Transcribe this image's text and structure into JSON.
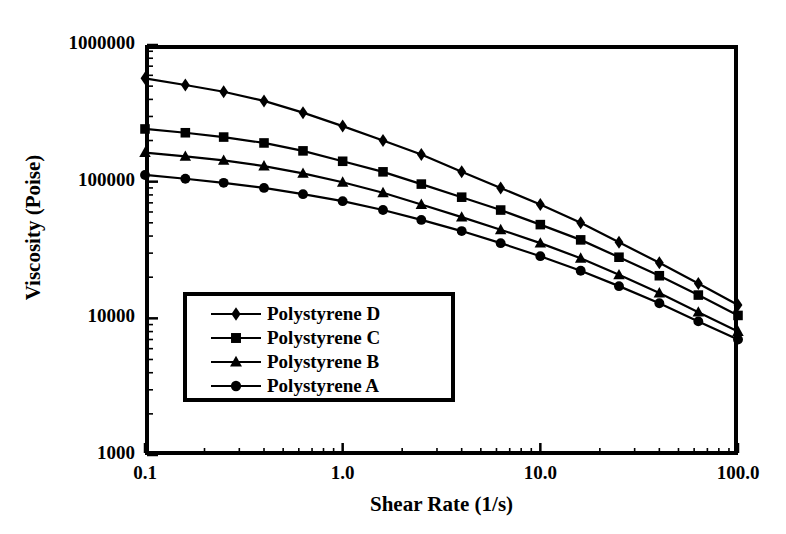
{
  "chart_data": {
    "type": "line",
    "title": "",
    "xlabel": "Shear Rate (1/s)",
    "ylabel": "Viscosity (Poise)",
    "xscale": "log",
    "yscale": "log",
    "xlim": [
      0.1,
      100.0
    ],
    "ylim": [
      1000,
      1000000
    ],
    "grid": false,
    "legend_position": "inside-left-lower",
    "xticks": [
      {
        "value": 0.1,
        "label": "0.1"
      },
      {
        "value": 1.0,
        "label": "1.0"
      },
      {
        "value": 10.0,
        "label": "10.0"
      },
      {
        "value": 100.0,
        "label": "100.0"
      }
    ],
    "yticks": [
      {
        "value": 1000,
        "label": "1000"
      },
      {
        "value": 10000,
        "label": "10000"
      },
      {
        "value": 100000,
        "label": "100000"
      },
      {
        "value": 1000000,
        "label": "1000000"
      }
    ],
    "x": [
      0.1,
      0.16,
      0.25,
      0.4,
      0.63,
      1.0,
      1.6,
      2.5,
      4.0,
      6.3,
      10.0,
      16.0,
      25.0,
      40.0,
      63.0,
      100.0
    ],
    "series": [
      {
        "name": "Polystyrene D",
        "marker": "diamond",
        "color": "#000000",
        "values": [
          570000,
          510000,
          455000,
          390000,
          320000,
          255000,
          200000,
          158000,
          118000,
          90000,
          68000,
          50000,
          36000,
          25500,
          18000,
          12500
        ]
      },
      {
        "name": "Polystyrene C",
        "marker": "square",
        "color": "#000000",
        "values": [
          243000,
          228000,
          212000,
          192000,
          168000,
          141000,
          118000,
          96000,
          77000,
          62000,
          48500,
          37500,
          28000,
          20500,
          14800,
          10500
        ]
      },
      {
        "name": "Polystyrene B",
        "marker": "triangle",
        "color": "#000000",
        "values": [
          163000,
          153000,
          143000,
          130000,
          115000,
          99000,
          83000,
          68000,
          55000,
          44500,
          35500,
          27500,
          20800,
          15300,
          11100,
          8000
        ]
      },
      {
        "name": "Polystyrene A",
        "marker": "circle",
        "color": "#000000",
        "values": [
          112000,
          105000,
          98000,
          90000,
          81000,
          72000,
          62000,
          52500,
          43500,
          35500,
          28500,
          22300,
          17200,
          12900,
          9500,
          7000
        ]
      }
    ]
  },
  "legend": {
    "items": [
      {
        "label": "Polystyrene D",
        "marker": "diamond"
      },
      {
        "label": "Polystyrene C",
        "marker": "square"
      },
      {
        "label": "Polystyrene B",
        "marker": "triangle"
      },
      {
        "label": "Polystyrene A",
        "marker": "circle"
      }
    ]
  },
  "axes": {
    "x_title": "Shear Rate (1/s)",
    "y_title": "Viscosity (Poise)"
  }
}
